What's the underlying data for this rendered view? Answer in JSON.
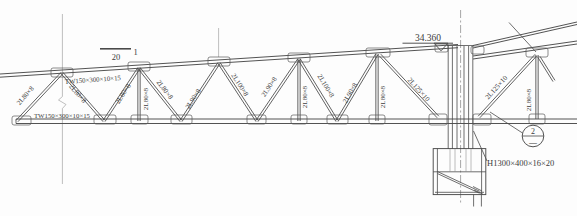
{
  "drawing": {
    "type": "structural-steel-truss-elevation",
    "colors": {
      "background": "#fdfdfd",
      "line": "#4a4a4a",
      "text": "#3c3c3c"
    },
    "annotations": {
      "elevation_value": "34.360",
      "section_mark_scale": "20",
      "section_mark_number": "1",
      "detail_bubble_number": "2",
      "detail_bubble_sheet": "—",
      "column_section": "H1300×400×16×20",
      "top_chord_section": "TW150×300×10×15",
      "bottom_chord_section": "TW150×300×10×15"
    },
    "labels": [
      {
        "name": "top-chord-label",
        "text": "TW150×300×10×15",
        "x": 93,
        "y": 82,
        "rot": -4,
        "size": 6.8
      },
      {
        "name": "bottom-chord-label",
        "text": "TW150×300×10×15",
        "x": 62,
        "y": 118,
        "rot": 0,
        "size": 6.8
      },
      {
        "name": "web-label",
        "text": "2L80×8",
        "x": 27,
        "y": 97,
        "rot": -50,
        "size": 7
      },
      {
        "name": "web-label",
        "text": "2L80×8",
        "x": 76,
        "y": 95,
        "rot": 50,
        "size": 7
      },
      {
        "name": "web-label",
        "text": "2L80×8",
        "x": 125,
        "y": 95,
        "rot": -57,
        "size": 7
      },
      {
        "name": "web-label",
        "text": "2L80×8",
        "x": 147.5,
        "y": 99,
        "rot": -90,
        "size": 7
      },
      {
        "name": "web-label",
        "text": "2L80×8",
        "x": 163,
        "y": 91,
        "rot": 52,
        "size": 7
      },
      {
        "name": "web-label",
        "text": "2L90×8",
        "x": 195,
        "y": 100,
        "rot": -57,
        "size": 7
      },
      {
        "name": "web-label",
        "text": "2L100×8",
        "x": 238,
        "y": 86,
        "rot": 57,
        "size": 7
      },
      {
        "name": "web-label",
        "text": "2L90×8",
        "x": 271,
        "y": 88,
        "rot": -56,
        "size": 7
      },
      {
        "name": "web-label",
        "text": "2L80×8",
        "x": 307,
        "y": 97,
        "rot": -90,
        "size": 7
      },
      {
        "name": "web-label",
        "text": "2L100×8",
        "x": 324,
        "y": 87,
        "rot": 59,
        "size": 7
      },
      {
        "name": "web-label",
        "text": "2L90×8",
        "x": 352,
        "y": 94,
        "rot": -60,
        "size": 7
      },
      {
        "name": "web-label",
        "text": "2L80×8",
        "x": 384.5,
        "y": 97,
        "rot": -90,
        "size": 7
      },
      {
        "name": "web-label",
        "text": "2L125×10",
        "x": 417,
        "y": 91,
        "rot": 48,
        "size": 7
      },
      {
        "name": "web-label",
        "text": "2L125×10",
        "x": 498,
        "y": 89,
        "rot": -48,
        "size": 7
      },
      {
        "name": "web-label",
        "text": "2L80×8",
        "x": 531,
        "y": 100,
        "rot": -90,
        "size": 7
      },
      {
        "name": "elevation-value",
        "text": "34.360",
        "x": 428,
        "y": 41,
        "rot": 0,
        "size": 9.5
      },
      {
        "name": "section-mark-scale",
        "text": "20",
        "x": 116,
        "y": 60,
        "rot": 0,
        "size": 8.5
      },
      {
        "name": "section-mark-number",
        "text": "1",
        "x": 135.5,
        "y": 55,
        "rot": 0,
        "size": 8.5
      },
      {
        "name": "detail-bubble-number",
        "text": "2",
        "x": 533,
        "y": 133.5,
        "rot": 0,
        "size": 8
      },
      {
        "name": "detail-bubble-sheet",
        "text": "—",
        "x": 533,
        "y": 145,
        "rot": 0,
        "size": 8
      },
      {
        "name": "column-section-label",
        "text": "H1300×400×16×20",
        "x": 487,
        "y": 165.5,
        "rot": 0,
        "size": 8.5,
        "anchor": "start"
      }
    ],
    "geometry": {
      "webs": [
        {
          "x1": 17,
          "y1": 121,
          "x2": 62,
          "y2": 73
        },
        {
          "x1": 62,
          "y1": 73,
          "x2": 104,
          "y2": 121
        },
        {
          "x1": 104,
          "y1": 121,
          "x2": 139,
          "y2": 68
        },
        {
          "x1": 139,
          "y1": 68,
          "x2": 139,
          "y2": 121
        },
        {
          "x1": 139,
          "y1": 68,
          "x2": 181,
          "y2": 121
        },
        {
          "x1": 181,
          "y1": 121,
          "x2": 219,
          "y2": 63
        },
        {
          "x1": 219,
          "y1": 63,
          "x2": 257,
          "y2": 121
        },
        {
          "x1": 257,
          "y1": 121,
          "x2": 299,
          "y2": 59
        },
        {
          "x1": 299,
          "y1": 59,
          "x2": 299,
          "y2": 121
        },
        {
          "x1": 299,
          "y1": 59,
          "x2": 337,
          "y2": 121
        },
        {
          "x1": 337,
          "y1": 121,
          "x2": 377,
          "y2": 54
        },
        {
          "x1": 377,
          "y1": 54,
          "x2": 377,
          "y2": 121
        },
        {
          "x1": 380,
          "y1": 55,
          "x2": 438,
          "y2": 117
        },
        {
          "x1": 479,
          "y1": 117,
          "x2": 536,
          "y2": 55
        },
        {
          "x1": 537,
          "y1": 55,
          "x2": 537,
          "y2": 119
        },
        {
          "x1": 539,
          "y1": 57,
          "x2": 554,
          "y2": 81
        }
      ],
      "gussets": [
        {
          "x": 51,
          "y": 68,
          "w": 22,
          "h": 9
        },
        {
          "x": 128,
          "y": 62,
          "w": 22,
          "h": 9
        },
        {
          "x": 208,
          "y": 57,
          "w": 22,
          "h": 9
        },
        {
          "x": 288,
          "y": 53,
          "w": 22,
          "h": 9
        },
        {
          "x": 366,
          "y": 48,
          "w": 24,
          "h": 9
        },
        {
          "x": 435,
          "y": 44,
          "w": 13,
          "h": 8
        },
        {
          "x": 471,
          "y": 46,
          "w": 13,
          "h": 8
        },
        {
          "x": 526,
          "y": 48,
          "w": 22,
          "h": 9
        },
        {
          "x": 12,
          "y": 116,
          "w": 19,
          "h": 9
        },
        {
          "x": 94,
          "y": 115,
          "w": 22,
          "h": 9
        },
        {
          "x": 131,
          "y": 115,
          "w": 17,
          "h": 9
        },
        {
          "x": 171,
          "y": 115,
          "w": 21,
          "h": 9
        },
        {
          "x": 247,
          "y": 115,
          "w": 19,
          "h": 9
        },
        {
          "x": 291,
          "y": 115,
          "w": 16,
          "h": 9
        },
        {
          "x": 327,
          "y": 115,
          "w": 21,
          "h": 9
        },
        {
          "x": 369,
          "y": 115,
          "w": 16,
          "h": 9
        },
        {
          "x": 429,
          "y": 114,
          "w": 18,
          "h": 11
        },
        {
          "x": 473,
          "y": 114,
          "w": 18,
          "h": 11
        },
        {
          "x": 529,
          "y": 114,
          "w": 16,
          "h": 10
        }
      ]
    }
  }
}
